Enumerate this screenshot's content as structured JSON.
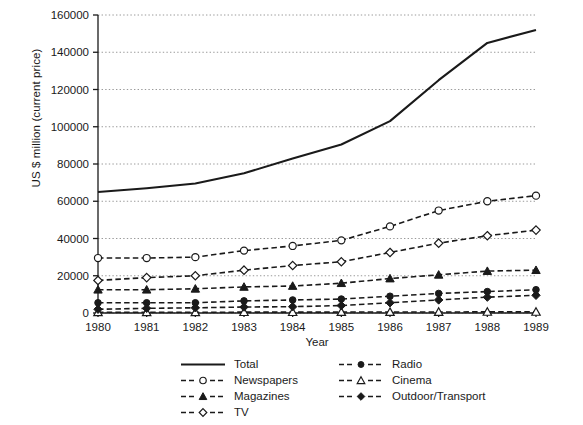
{
  "chart_data": {
    "type": "line",
    "title": "",
    "xlabel": "Year",
    "ylabel": "US $ million (current price)",
    "categories": [
      1980,
      1981,
      1982,
      1983,
      1984,
      1985,
      1986,
      1987,
      1988,
      1989
    ],
    "x_tick_labels": [
      "1980",
      "1981",
      "1982",
      "1983",
      "1984",
      "1985",
      "1986",
      "1987",
      "1988",
      "1989"
    ],
    "y_tick_labels": [
      "0",
      "20000",
      "40000",
      "60000",
      "80000",
      "100000",
      "120000",
      "140000",
      "160000"
    ],
    "y_ticks": [
      0,
      20000,
      40000,
      60000,
      80000,
      100000,
      120000,
      140000,
      160000
    ],
    "ylim": [
      0,
      160000
    ],
    "xlim": [
      1980,
      1989
    ],
    "grid": "horizontal-dotted",
    "legend_position": "below-center",
    "legend_columns": 2,
    "series": [
      {
        "name": "Total",
        "line": "solid",
        "marker": "none",
        "color": "#1a1a1a",
        "values": [
          65000,
          67000,
          69500,
          75000,
          83000,
          90500,
          103000,
          125000,
          145000,
          152000
        ]
      },
      {
        "name": "Newspapers",
        "line": "dashed",
        "marker": "open-circle",
        "color": "#1a1a1a",
        "values": [
          29500,
          29500,
          30000,
          33500,
          36000,
          39000,
          46500,
          55000,
          60000,
          63000
        ]
      },
      {
        "name": "Magazines",
        "line": "dashed",
        "marker": "filled-triangle",
        "color": "#1a1a1a",
        "values": [
          12500,
          12500,
          13000,
          14000,
          14500,
          16000,
          18500,
          20500,
          22500,
          23000
        ]
      },
      {
        "name": "TV",
        "line": "dashed",
        "marker": "open-diamond",
        "color": "#1a1a1a",
        "values": [
          17500,
          19000,
          20000,
          23000,
          25500,
          27500,
          32500,
          37500,
          41500,
          44500
        ]
      },
      {
        "name": "Radio",
        "line": "dashed",
        "marker": "filled-circle",
        "color": "#1a1a1a",
        "values": [
          5500,
          5500,
          5500,
          6500,
          7000,
          7500,
          9000,
          10500,
          11500,
          12500
        ]
      },
      {
        "name": "Cinema",
        "line": "dashed",
        "marker": "open-triangle",
        "color": "#1a1a1a",
        "values": [
          400,
          400,
          400,
          450,
          450,
          500,
          500,
          550,
          600,
          600
        ]
      },
      {
        "name": "Outdoor/Transport",
        "line": "dashed",
        "marker": "filled-diamond",
        "color": "#1a1a1a",
        "values": [
          2000,
          2500,
          2800,
          3200,
          3400,
          4000,
          5500,
          7000,
          8500,
          9500
        ]
      }
    ]
  },
  "axes": {
    "y_title": "US $ million (current price)",
    "x_title": "Year"
  },
  "legend": {
    "items": [
      {
        "label": "Total",
        "marker": "none",
        "line": "solid"
      },
      {
        "label": "Radio",
        "marker": "filled-circle",
        "line": "dashed"
      },
      {
        "label": "Newspapers",
        "marker": "open-circle",
        "line": "dashed"
      },
      {
        "label": "Cinema",
        "marker": "open-triangle",
        "line": "dashed"
      },
      {
        "label": "Magazines",
        "marker": "filled-triangle",
        "line": "dashed"
      },
      {
        "label": "Outdoor/Transport",
        "marker": "filled-diamond",
        "line": "dashed"
      },
      {
        "label": "TV",
        "marker": "open-diamond",
        "line": "dashed"
      }
    ]
  },
  "style": {
    "ink": "#1a1a1a",
    "grid_color": "#9a9a9a",
    "background": "#ffffff"
  }
}
